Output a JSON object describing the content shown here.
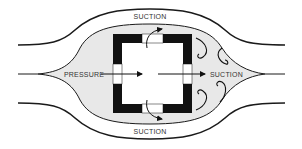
{
  "diagram": {
    "labels": {
      "top": "SUCTION",
      "bottom": "SUCTION",
      "left": "PRESSURE",
      "right": "SUCTION"
    },
    "colors": {
      "background": "#ffffff",
      "bubble_fill": "#e8e8e8",
      "stroke": "#1a1a1a",
      "wall": "#111111"
    }
  }
}
